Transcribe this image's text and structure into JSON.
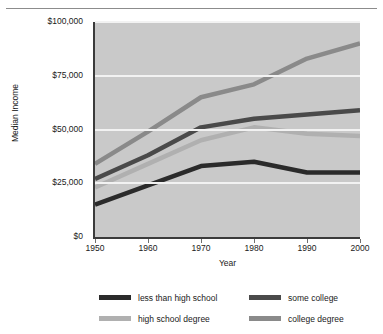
{
  "chart_data": {
    "type": "line",
    "title": "",
    "xlabel": "Year",
    "ylabel": "Median Income",
    "categories": [
      1950,
      1960,
      1970,
      1980,
      1990,
      2000
    ],
    "x_tick_labels": [
      "1950",
      "1960",
      "1970",
      "1980",
      "1990",
      "2000"
    ],
    "y_tick_labels": [
      "$0",
      "$25,000",
      "$50,000",
      "$75,000",
      "$100,000"
    ],
    "y_ticks": [
      0,
      25000,
      50000,
      75000,
      100000
    ],
    "xlim": [
      1950,
      2000
    ],
    "ylim": [
      0,
      100000
    ],
    "grid": true,
    "legend_position": "bottom",
    "plot_background": "#c9c9c9",
    "gridline_color": "#f2f2f2",
    "series": [
      {
        "name": "less than high school",
        "color": "#2b2b2b",
        "values": [
          15000,
          24000,
          33000,
          35000,
          30000,
          30000
        ]
      },
      {
        "name": "high school degree",
        "color": "#b0b0b0",
        "values": [
          23000,
          34000,
          45000,
          51000,
          48000,
          47000
        ]
      },
      {
        "name": "some college",
        "color": "#4a4a4a",
        "values": [
          27000,
          38000,
          51000,
          55000,
          57000,
          59000
        ]
      },
      {
        "name": "college degree",
        "color": "#8a8a8a",
        "values": [
          34000,
          49000,
          65000,
          71000,
          83000,
          90000
        ]
      }
    ]
  },
  "legend": {
    "items": [
      {
        "label": "less than high school",
        "color": "#2b2b2b"
      },
      {
        "label": "some college",
        "color": "#4a4a4a"
      },
      {
        "label": "high school degree",
        "color": "#b0b0b0"
      },
      {
        "label": "college degree",
        "color": "#8a8a8a"
      }
    ]
  }
}
